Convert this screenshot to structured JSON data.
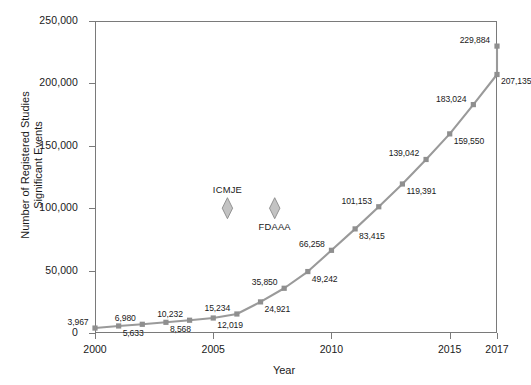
{
  "chart_data": {
    "type": "line",
    "title": "",
    "xlabel": "Year",
    "ylabel": "Number of Registered Studies\nSignificant Events",
    "ylabel_line1": "Number of Registered Studies",
    "ylabel_line2": "Significant Events",
    "xlim": [
      2000,
      2017
    ],
    "ylim": [
      0,
      250000
    ],
    "grid": false,
    "legend": "none",
    "yticks": [
      0,
      50000,
      100000,
      150000,
      200000,
      250000
    ],
    "ytick_labels": [
      "0",
      "50,000",
      "100,000",
      "150,000",
      "200,000",
      "250,000"
    ],
    "xticks": [
      2000,
      2005,
      2010,
      2015,
      2017
    ],
    "xtick_labels": [
      "2000",
      "2005",
      "2010",
      "2015",
      "2017"
    ],
    "x": [
      2000,
      2001,
      2002,
      2003,
      2004,
      2005,
      2006,
      2007,
      2008,
      2009,
      2010,
      2011,
      2012,
      2013,
      2014,
      2015,
      2016,
      2017
    ],
    "values": [
      3967,
      5633,
      6980,
      8568,
      10232,
      12019,
      15234,
      24921,
      35850,
      49242,
      66258,
      83415,
      101153,
      119391,
      139042,
      159550,
      183024,
      207135
    ],
    "final_value": 229884,
    "point_labels": [
      {
        "value": 3967,
        "text": "3,967",
        "x": 2000,
        "side": "above"
      },
      {
        "value": 5633,
        "text": "5,633",
        "x": 2001,
        "side": "below"
      },
      {
        "value": 6980,
        "text": "6,980",
        "x": 2002,
        "side": "above"
      },
      {
        "value": 8568,
        "text": "8,568",
        "x": 2003,
        "side": "below"
      },
      {
        "value": 10232,
        "text": "10,232",
        "x": 2004,
        "side": "above"
      },
      {
        "value": 12019,
        "text": "12,019",
        "x": 2005,
        "side": "below"
      },
      {
        "value": 15234,
        "text": "15,234",
        "x": 2006,
        "side": "above"
      },
      {
        "value": 24921,
        "text": "24,921",
        "x": 2007,
        "side": "below"
      },
      {
        "value": 35850,
        "text": "35,850",
        "x": 2008,
        "side": "above"
      },
      {
        "value": 49242,
        "text": "49,242",
        "x": 2009,
        "side": "below"
      },
      {
        "value": 66258,
        "text": "66,258",
        "x": 2010,
        "side": "above"
      },
      {
        "value": 83415,
        "text": "83,415",
        "x": 2011,
        "side": "below"
      },
      {
        "value": 101153,
        "text": "101,153",
        "x": 2012,
        "side": "above"
      },
      {
        "value": 119391,
        "text": "119,391",
        "x": 2013,
        "side": "below"
      },
      {
        "value": 139042,
        "text": "139,042",
        "x": 2014,
        "side": "above"
      },
      {
        "value": 159550,
        "text": "159,550",
        "x": 2015,
        "side": "below"
      },
      {
        "value": 183024,
        "text": "183,024",
        "x": 2016,
        "side": "above"
      },
      {
        "value": 207135,
        "text": "207,135",
        "x": 2017,
        "side": "below"
      },
      {
        "value": 229884,
        "text": "229,884",
        "x": 2018,
        "side": "above"
      }
    ],
    "annotations": [
      {
        "name": "ICMJE",
        "label": "ICMJE",
        "x": 2005.6,
        "y": 100000,
        "marker": "diamond"
      },
      {
        "name": "FDAAA",
        "label": "FDAAA",
        "x": 2007.6,
        "y": 100000,
        "marker": "diamond"
      }
    ],
    "colors": {
      "line": "#9a9a9a",
      "marker": "#8f8f8f",
      "axis": "#7a7a7a",
      "text": "#1a1a1a",
      "annotation_marker": "#c3c3c3",
      "annotation_marker_edge": "#8a8a8a",
      "background": "#ffffff"
    },
    "marker_style": "square",
    "line_width": 2.1
  }
}
